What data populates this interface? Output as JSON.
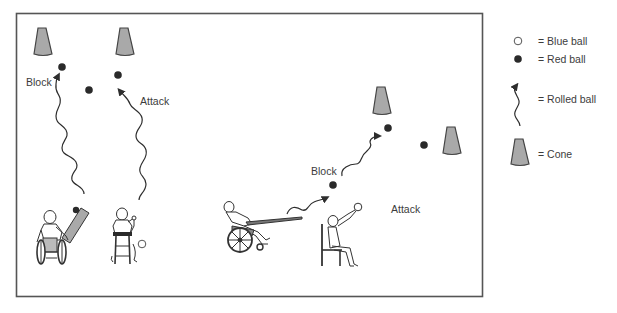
{
  "field": {
    "labels": {
      "block_left": "Block",
      "attack_left": "Attack",
      "block_right": "Block",
      "attack_right": "Attack"
    }
  },
  "legend": {
    "items": [
      {
        "icon": "blue-ball-icon",
        "label": "= Blue ball"
      },
      {
        "icon": "red-ball-icon",
        "label": "= Red ball"
      },
      {
        "icon": "rolled-ball-icon",
        "label": "= Rolled ball"
      },
      {
        "icon": "cone-icon",
        "label": "= Cone"
      }
    ]
  },
  "colors": {
    "border": "#555555",
    "cone_fill": "#a9a9a9",
    "cone_stroke": "#444444",
    "red_ball": "#2a2a2a",
    "blue_ball_fill": "#ffffff",
    "line": "#2e2e2e",
    "text": "#3c3c3c"
  }
}
